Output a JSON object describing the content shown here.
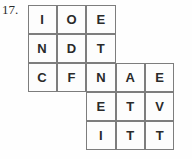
{
  "question": {
    "number_label": "17."
  },
  "grid": {
    "columns": 5,
    "rows": 5,
    "cell_size_px": 29,
    "border_color": "#7d7d7d",
    "letter_color": "#2a2a2a",
    "cell_background": "#fdfdfd",
    "rows_data": [
      {
        "start_column": 1,
        "letters": [
          "I",
          "O",
          "E"
        ]
      },
      {
        "start_column": 1,
        "letters": [
          "N",
          "D",
          "T"
        ]
      },
      {
        "start_column": 1,
        "letters": [
          "C",
          "F",
          "N",
          "A",
          "E"
        ]
      },
      {
        "start_column": 3,
        "letters": [
          "E",
          "T",
          "V"
        ]
      },
      {
        "start_column": 3,
        "letters": [
          "I",
          "T",
          "T"
        ]
      }
    ]
  }
}
